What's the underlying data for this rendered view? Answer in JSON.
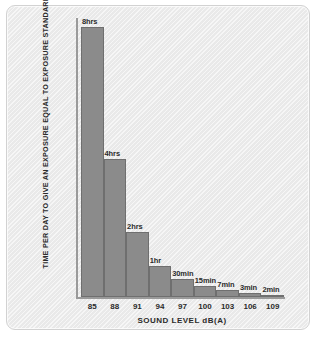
{
  "chart_data": {
    "type": "bar",
    "title": "",
    "xlabel": "SOUND LEVEL dB(A)",
    "ylabel": "TIME PER DAY TO GIVE AN EXPOSURE EQUAL TO EXPOSURE STANDARD",
    "categories": [
      "85",
      "88",
      "91",
      "94",
      "97",
      "100",
      "103",
      "106",
      "109"
    ],
    "value_labels": [
      "8hrs",
      "4hrs",
      "2hrs",
      "1hr",
      "30min",
      "15min",
      "7min",
      "3min",
      "2min"
    ],
    "values_minutes": [
      480,
      240,
      120,
      60,
      30,
      15,
      7,
      3,
      2
    ],
    "bar_pixel_heights": [
      270,
      138,
      65,
      31,
      18,
      11,
      7,
      4,
      2
    ],
    "grid": false,
    "legend": false,
    "bar_color": "#8b8b8b",
    "bar_border_color": "#6f6f6f",
    "axis_color": "#9a9a9a",
    "background_color": "#ececec",
    "text_color": "#2b2b2b"
  }
}
